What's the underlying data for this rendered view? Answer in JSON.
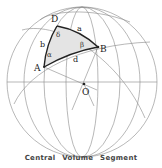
{
  "figure": {
    "title": "Central Volume Segment",
    "points": [
      {
        "id": "D",
        "label": "D",
        "x": 57,
        "y": 26,
        "lx": 51,
        "ly": 22
      },
      {
        "id": "B",
        "label": "B",
        "x": 98,
        "y": 47,
        "lx": 100,
        "ly": 52
      },
      {
        "id": "A",
        "label": "A",
        "x": 44,
        "y": 67,
        "lx": 34,
        "ly": 71
      },
      {
        "id": "O",
        "label": "O",
        "x": 84,
        "y": 84,
        "lx": 82,
        "ly": 95
      }
    ],
    "sides": [
      {
        "id": "a",
        "label": "a",
        "lx": 77,
        "ly": 31
      },
      {
        "id": "b",
        "label": "b",
        "lx": 40,
        "ly": 47
      },
      {
        "id": "d",
        "label": "d",
        "lx": 73,
        "ly": 62
      }
    ],
    "angles": [
      {
        "id": "delta",
        "label": "δ",
        "lx": 56,
        "ly": 37
      },
      {
        "id": "beta",
        "label": "β",
        "lx": 80,
        "ly": 47
      },
      {
        "id": "alpha",
        "label": "α",
        "lx": 47,
        "ly": 57
      }
    ],
    "colors": {
      "sphere_line": "#777777",
      "triangle_edge": "#222222",
      "triangle_fill": "#e4e4e4",
      "text": "#222222"
    }
  }
}
